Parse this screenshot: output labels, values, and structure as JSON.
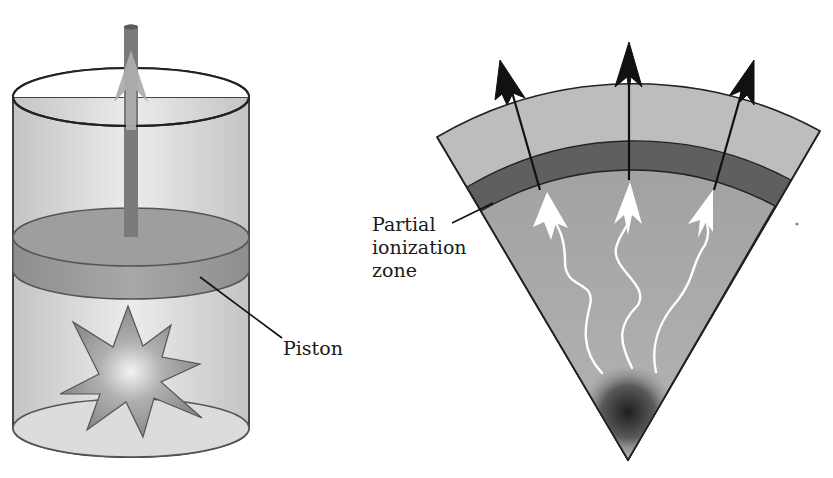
{
  "figure": {
    "left_panel": {
      "title": "Piston analogy",
      "labels": {
        "piston": "Piston"
      }
    },
    "right_panel": {
      "title": "Stellar wedge with partial ionization zone",
      "labels": {
        "zone_line1": "Partial",
        "zone_line2": "ionization",
        "zone_line3": "zone"
      },
      "outgoing_arrows": 3,
      "heat_arrows": 3
    }
  },
  "colors": {
    "cylinder_fill": "#cfcfcf",
    "piston_fill": "#9a9a9a",
    "rod": "#6e6e6e",
    "up_arrow": "#a8a8a8",
    "explosion": "#8e8e8e",
    "wedge_outer": "#bdbdbd",
    "wedge_zone": "#5e5e5e",
    "wedge_inner": "#9c9c9c",
    "heat_arrow": "#ffffff",
    "outgoing_arrow": "#111111"
  }
}
